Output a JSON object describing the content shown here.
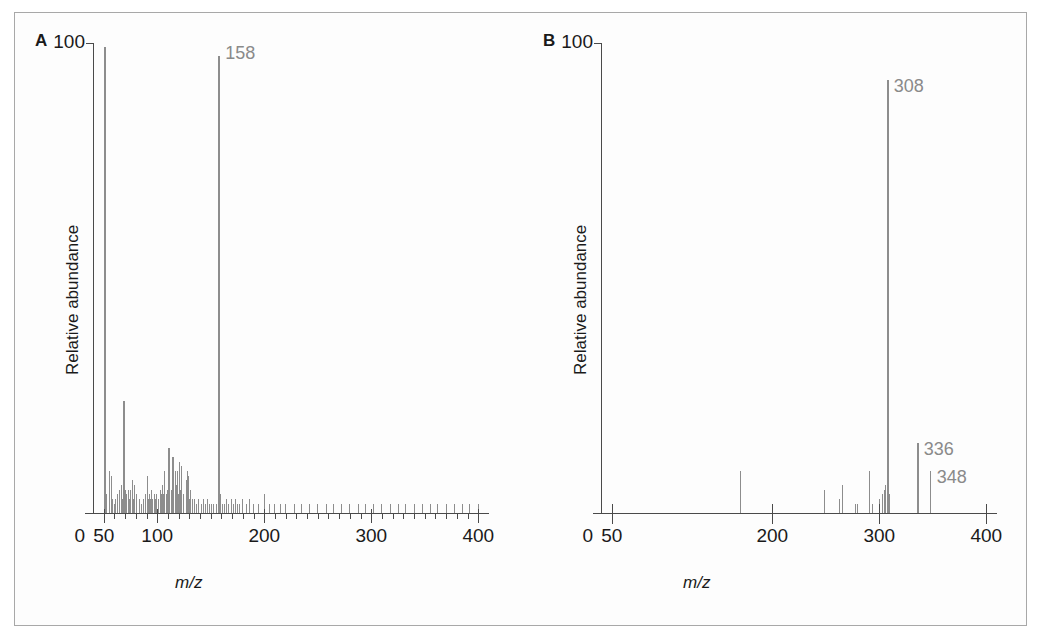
{
  "figure": {
    "panels": [
      {
        "letter": "A",
        "y_axis": {
          "title": "Relative abundance",
          "max_label": "100",
          "min_label": "0",
          "max": 100,
          "min": 0
        },
        "x_axis": {
          "title": "m/z",
          "ticks": [
            "50",
            "100",
            "200",
            "300",
            "400"
          ],
          "tick_values": [
            50,
            100,
            200,
            300,
            400
          ],
          "min": 40,
          "max": 410,
          "minor_tick_step": 10
        },
        "peak_labels": [
          {
            "text": "158",
            "mz": 158
          }
        ],
        "base_peak_mz": 158
      },
      {
        "letter": "B",
        "y_axis": {
          "title": "Relative abundance",
          "max_label": "100",
          "min_label": "0",
          "max": 100,
          "min": 0
        },
        "x_axis": {
          "title": "m/z",
          "ticks": [
            "50",
            "200",
            "300",
            "400"
          ],
          "tick_values": [
            50,
            200,
            300,
            400
          ],
          "min": 40,
          "max": 410,
          "minor_tick_step": 0
        },
        "peak_labels": [
          {
            "text": "308",
            "mz": 308
          },
          {
            "text": "336",
            "mz": 336
          },
          {
            "text": "348",
            "mz": 348
          }
        ],
        "base_peak_mz": 308
      }
    ],
    "colors": {
      "peak": "#8d8d8d",
      "axis": "#4a4a4a",
      "text": "#1a1a1a",
      "label": "#8a8a8a",
      "frame": "#a8a8a8"
    }
  },
  "chart_data": [
    {
      "type": "bar",
      "title": "A",
      "xlabel": "m/z",
      "ylabel": "Relative abundance",
      "xlim": [
        40,
        410
      ],
      "ylim": [
        0,
        100
      ],
      "grid": false,
      "legend": "none",
      "annotations": [
        {
          "text": "158",
          "x": 158,
          "y": 100
        }
      ],
      "x": [
        51,
        53,
        55,
        57,
        58,
        60,
        61,
        63,
        65,
        67,
        68,
        69,
        70,
        71,
        73,
        74,
        75,
        77,
        78,
        79,
        81,
        83,
        85,
        87,
        89,
        91,
        92,
        93,
        94,
        95,
        96,
        97,
        98,
        99,
        101,
        103,
        104,
        105,
        106,
        107,
        109,
        110,
        111,
        113,
        115,
        117,
        118,
        119,
        120,
        121,
        122,
        123,
        125,
        127,
        128,
        129,
        130,
        131,
        133,
        135,
        137,
        139,
        141,
        143,
        145,
        147,
        149,
        151,
        153,
        155,
        157,
        158,
        159,
        161,
        163,
        165,
        167,
        169,
        171,
        173,
        175,
        177,
        180,
        183,
        186,
        190,
        195,
        200,
        205,
        210,
        215,
        220,
        228,
        235,
        242,
        250,
        258,
        265,
        272,
        280,
        288,
        295,
        302,
        310,
        318,
        325,
        332,
        340,
        348,
        355,
        362,
        370,
        378,
        385,
        392,
        400
      ],
      "values": [
        100,
        4,
        9,
        8,
        3,
        2,
        3,
        4,
        5,
        6,
        3,
        24,
        5,
        4,
        5,
        3,
        5,
        7,
        3,
        6,
        4,
        3,
        2,
        3,
        4,
        8,
        3,
        4,
        3,
        5,
        3,
        4,
        3,
        4,
        3,
        5,
        4,
        6,
        4,
        9,
        4,
        5,
        14,
        5,
        12,
        9,
        6,
        9,
        4,
        11,
        5,
        10,
        4,
        7,
        9,
        8,
        3,
        5,
        3,
        3,
        2,
        3,
        2,
        3,
        2,
        3,
        2,
        2,
        2,
        2,
        2,
        98,
        4,
        2,
        2,
        3,
        2,
        3,
        2,
        3,
        2,
        2,
        3,
        2,
        3,
        2,
        2,
        4,
        2,
        2,
        2,
        2,
        2,
        2,
        2,
        2,
        2,
        2,
        2,
        2,
        2,
        2,
        2,
        2,
        2,
        2,
        2,
        2,
        2,
        2,
        2,
        2,
        2,
        2,
        2,
        2
      ]
    },
    {
      "type": "bar",
      "title": "B",
      "xlabel": "m/z",
      "ylabel": "Relative abundance",
      "xlim": [
        40,
        410
      ],
      "ylim": [
        0,
        100
      ],
      "grid": false,
      "legend": "none",
      "annotations": [
        {
          "text": "308",
          "x": 308,
          "y": 93
        },
        {
          "text": "336",
          "x": 336,
          "y": 15
        },
        {
          "text": "348",
          "x": 348,
          "y": 9
        }
      ],
      "x": [
        170,
        249,
        263,
        266,
        278,
        280,
        291,
        294,
        300,
        303,
        305,
        306,
        308,
        310,
        336,
        348
      ],
      "values": [
        9,
        5,
        3,
        6,
        2,
        2,
        9,
        2,
        3,
        4,
        5,
        6,
        93,
        4,
        15,
        9
      ]
    }
  ]
}
